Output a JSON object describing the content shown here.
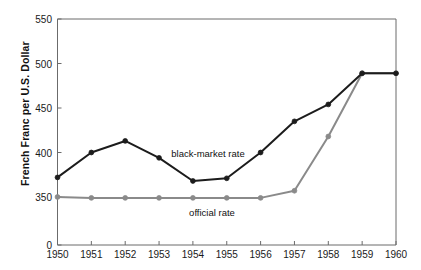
{
  "chart_data": {
    "type": "line",
    "title": "",
    "xlabel": "",
    "ylabel": "French Franc per U.S. Dollar",
    "x": [
      1950,
      1951,
      1952,
      1953,
      1954,
      1955,
      1956,
      1957,
      1958,
      1959,
      1960
    ],
    "xtick_labels": [
      "1950",
      "1951",
      "1952",
      "1953",
      "1954",
      "1955",
      "1956",
      "1957",
      "1958",
      "1959",
      "1960"
    ],
    "ytick_labels": [
      "0",
      "350",
      "400",
      "450",
      "500",
      "550"
    ],
    "ytick_values": [
      0,
      350,
      400,
      450,
      500,
      550
    ],
    "ylim": [
      350,
      550
    ],
    "axis_break": true,
    "axis_break_note": "y-axis starts at 0 then jumps to 350",
    "grid": false,
    "legend_position": "inline-annotations",
    "series": [
      {
        "name": "black-market rate",
        "color": "#1c1c1c",
        "marker": "circle",
        "annotation": "black-market rate",
        "values": [
          372,
          400,
          413,
          394,
          368,
          371,
          400,
          435,
          454,
          489,
          489
        ]
      },
      {
        "name": "official rate",
        "color": "#8a8a8a",
        "marker": "circle",
        "annotation": "official rate",
        "values": [
          350,
          349,
          349,
          349,
          349,
          349,
          349,
          357,
          418,
          489,
          489
        ]
      }
    ],
    "annotations": [
      {
        "text": "black-market rate",
        "x_px": 208,
        "y_px": 153
      },
      {
        "text": "official rate",
        "x_px": 212,
        "y_px": 212
      }
    ]
  },
  "colors": {
    "black_market": "#1c1c1c",
    "official": "#8a8a8a",
    "axis": "#6b6b6b",
    "background": "#ffffff",
    "text": "#1a1a1a"
  }
}
